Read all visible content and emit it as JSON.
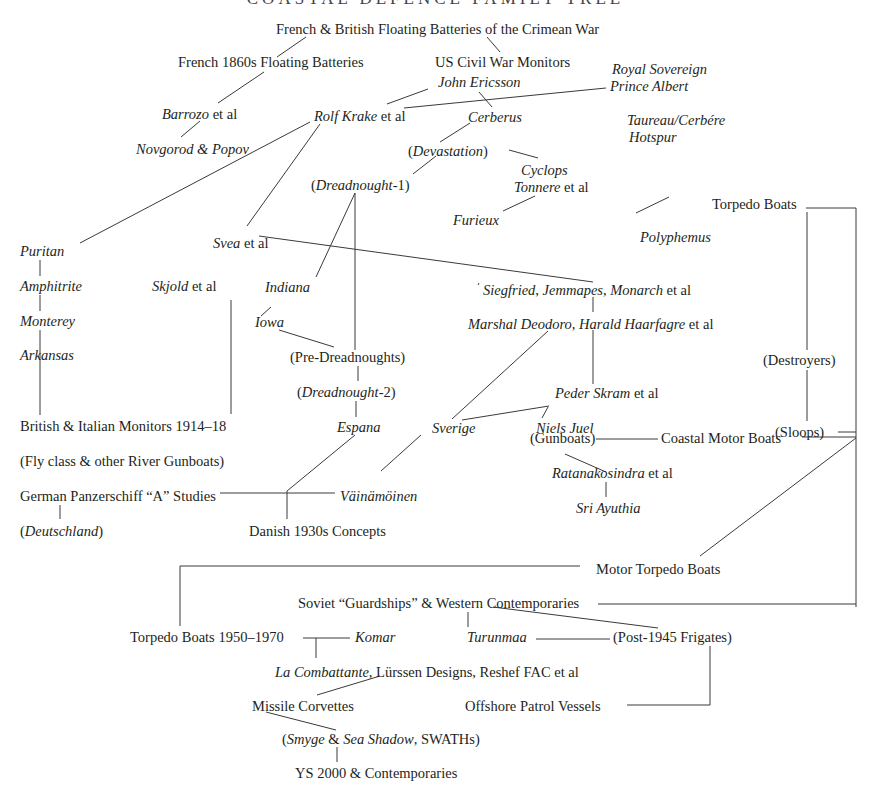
{
  "title": "COASTAL DEFENCE FAMILY TREE",
  "colors": {
    "ink": "#231f20",
    "line": "#3a3a3a",
    "background": "#ffffff"
  },
  "nodes": [
    {
      "id": "crimean",
      "parts": [
        {
          "t": "French & British Floating Batteries of the Crimean War"
        }
      ],
      "x": 276,
      "y": 21
    },
    {
      "id": "french1860s",
      "parts": [
        {
          "t": "French 1860s Floating Batteries"
        }
      ],
      "x": 178,
      "y": 54
    },
    {
      "id": "uscivilwar",
      "parts": [
        {
          "t": "US Civil War Monitors"
        }
      ],
      "x": 435,
      "y": 54
    },
    {
      "id": "royalsovereign",
      "parts": [
        {
          "t": "Royal Sovereign",
          "i": true
        }
      ],
      "x": 612,
      "y": 61
    },
    {
      "id": "princealbert",
      "parts": [
        {
          "t": "Prince Albert",
          "i": true
        }
      ],
      "x": 610,
      "y": 78
    },
    {
      "id": "johnericsson",
      "parts": [
        {
          "t": "John Ericsson",
          "i": true
        }
      ],
      "x": 438,
      "y": 74
    },
    {
      "id": "barrozo",
      "parts": [
        {
          "t": "Barrozo",
          "i": true
        },
        {
          "t": " et al"
        }
      ],
      "x": 162,
      "y": 106
    },
    {
      "id": "rolfkrake",
      "parts": [
        {
          "t": "Rolf Krake",
          "i": true
        },
        {
          "t": " et al"
        }
      ],
      "x": 314,
      "y": 108
    },
    {
      "id": "cerberus",
      "parts": [
        {
          "t": "Cerberus",
          "i": true
        }
      ],
      "x": 468,
      "y": 109
    },
    {
      "id": "taureau",
      "parts": [
        {
          "t": "Taureau/Cerbére",
          "i": true
        }
      ],
      "x": 627,
      "y": 112
    },
    {
      "id": "hotspur",
      "parts": [
        {
          "t": "Hotspur",
          "i": true
        }
      ],
      "x": 629,
      "y": 129
    },
    {
      "id": "novgorod",
      "parts": [
        {
          "t": "Novgorod & Popov",
          "i": true
        }
      ],
      "x": 136,
      "y": 141
    },
    {
      "id": "devastation",
      "parts": [
        {
          "t": "("
        },
        {
          "t": "Devastation",
          "i": true
        },
        {
          "t": ")"
        }
      ],
      "x": 408,
      "y": 143
    },
    {
      "id": "cyclops",
      "parts": [
        {
          "t": "Cyclops",
          "i": true
        }
      ],
      "x": 521,
      "y": 162
    },
    {
      "id": "dreadnought1",
      "parts": [
        {
          "t": "("
        },
        {
          "t": "Dreadnought",
          "i": true
        },
        {
          "t": "-1)"
        }
      ],
      "x": 311,
      "y": 177
    },
    {
      "id": "tonnere",
      "parts": [
        {
          "t": "Tonnere",
          "i": true
        },
        {
          "t": " et al"
        }
      ],
      "x": 514,
      "y": 179
    },
    {
      "id": "furieux",
      "parts": [
        {
          "t": "Furieux",
          "i": true
        }
      ],
      "x": 453,
      "y": 212
    },
    {
      "id": "torpedoboats",
      "parts": [
        {
          "t": "Torpedo Boats"
        }
      ],
      "x": 712,
      "y": 196
    },
    {
      "id": "polyphemus",
      "parts": [
        {
          "t": "Polyphemus",
          "i": true
        }
      ],
      "x": 640,
      "y": 229
    },
    {
      "id": "svea",
      "parts": [
        {
          "t": "Svea",
          "i": true
        },
        {
          "t": " et al"
        }
      ],
      "x": 213,
      "y": 235
    },
    {
      "id": "puritan",
      "parts": [
        {
          "t": "Puritan",
          "i": true
        }
      ],
      "x": 20,
      "y": 243
    },
    {
      "id": "amphitrite",
      "parts": [
        {
          "t": "Amphitrite",
          "i": true
        }
      ],
      "x": 20,
      "y": 278
    },
    {
      "id": "skjold",
      "parts": [
        {
          "t": "Skjold",
          "i": true
        },
        {
          "t": " et al"
        }
      ],
      "x": 152,
      "y": 278
    },
    {
      "id": "indiana",
      "parts": [
        {
          "t": "Indiana",
          "i": true
        }
      ],
      "x": 265,
      "y": 279
    },
    {
      "id": "siegfried",
      "parts": [
        {
          "t": "Siegfried",
          "i": true
        },
        {
          "t": ", "
        },
        {
          "t": "Jemmapes",
          "i": true
        },
        {
          "t": ", "
        },
        {
          "t": "Monarch",
          "i": true
        },
        {
          "t": " et al"
        }
      ],
      "x": 483,
      "y": 282
    },
    {
      "id": "monterey",
      "parts": [
        {
          "t": "Monterey",
          "i": true
        }
      ],
      "x": 20,
      "y": 313
    },
    {
      "id": "iowa",
      "parts": [
        {
          "t": "Iowa",
          "i": true
        }
      ],
      "x": 255,
      "y": 314
    },
    {
      "id": "marshal",
      "parts": [
        {
          "t": "Marshal Deodoro",
          "i": true
        },
        {
          "t": ", "
        },
        {
          "t": "Harald Haarfagre",
          "i": true
        },
        {
          "t": " et al"
        }
      ],
      "x": 468,
      "y": 316
    },
    {
      "id": "predreadnoughts",
      "parts": [
        {
          "t": "(Pre-Dreadnoughts)"
        }
      ],
      "x": 290,
      "y": 349
    },
    {
      "id": "arkansas",
      "parts": [
        {
          "t": "Arkansas",
          "i": true
        }
      ],
      "x": 20,
      "y": 347
    },
    {
      "id": "destroyers",
      "parts": [
        {
          "t": "(Destroyers)"
        }
      ],
      "x": 763,
      "y": 352
    },
    {
      "id": "dreadnought2",
      "parts": [
        {
          "t": "("
        },
        {
          "t": "Dreadnought",
          "i": true
        },
        {
          "t": "-2)"
        }
      ],
      "x": 297,
      "y": 384
    },
    {
      "id": "pederskram",
      "parts": [
        {
          "t": "Peder Skram",
          "i": true
        },
        {
          "t": " et al"
        }
      ],
      "x": 555,
      "y": 385
    },
    {
      "id": "britishitalian",
      "parts": [
        {
          "t": "British & Italian Monitors 1914–18"
        }
      ],
      "x": 20,
      "y": 418
    },
    {
      "id": "espana",
      "parts": [
        {
          "t": "Espana",
          "i": true
        }
      ],
      "x": 337,
      "y": 419
    },
    {
      "id": "sverige",
      "parts": [
        {
          "t": "Sverige",
          "i": true
        }
      ],
      "x": 432,
      "y": 420
    },
    {
      "id": "nielsjuel",
      "parts": [
        {
          "t": "Niels Juel",
          "i": true
        }
      ],
      "x": 536,
      "y": 420
    },
    {
      "id": "sloops",
      "parts": [
        {
          "t": "(Sloops)"
        }
      ],
      "x": 775,
      "y": 424
    },
    {
      "id": "flyclass",
      "parts": [
        {
          "t": "(Fly class & other River Gunboats)"
        }
      ],
      "x": 20,
      "y": 453
    },
    {
      "id": "gunboats",
      "parts": [
        {
          "t": "(Gunboats)"
        }
      ],
      "x": 530,
      "y": 430
    },
    {
      "id": "coastalmotor",
      "parts": [
        {
          "t": "Coastal Motor Boats"
        }
      ],
      "x": 661,
      "y": 430
    },
    {
      "id": "panzerschiff",
      "parts": [
        {
          "t": "German Panzerschiff “A” Studies"
        }
      ],
      "x": 20,
      "y": 488
    },
    {
      "id": "vainamoinen",
      "parts": [
        {
          "t": "Väinämöinen",
          "i": true
        }
      ],
      "x": 340,
      "y": 488
    },
    {
      "id": "ratanakosindra",
      "parts": [
        {
          "t": "Ratanakosindra",
          "i": true
        },
        {
          "t": " et al"
        }
      ],
      "x": 552,
      "y": 465
    },
    {
      "id": "deutschland",
      "parts": [
        {
          "t": "("
        },
        {
          "t": "Deutschland",
          "i": true
        },
        {
          "t": ")"
        }
      ],
      "x": 20,
      "y": 523
    },
    {
      "id": "danish",
      "parts": [
        {
          "t": "Danish 1930s Concepts"
        }
      ],
      "x": 249,
      "y": 523
    },
    {
      "id": "sriayuthia",
      "parts": [
        {
          "t": "Sri Ayuthia",
          "i": true
        }
      ],
      "x": 576,
      "y": 500
    },
    {
      "id": "motortorpedo",
      "parts": [
        {
          "t": "Motor Torpedo Boats"
        }
      ],
      "x": 596,
      "y": 561
    },
    {
      "id": "soviet",
      "parts": [
        {
          "t": "Soviet “Guardships” & Western Contemporaries"
        }
      ],
      "x": 298,
      "y": 595
    },
    {
      "id": "tb1950",
      "parts": [
        {
          "t": "Torpedo Boats 1950–1970"
        }
      ],
      "x": 130,
      "y": 629
    },
    {
      "id": "komar",
      "parts": [
        {
          "t": "Komar",
          "i": true
        }
      ],
      "x": 355,
      "y": 629
    },
    {
      "id": "turunmaa",
      "parts": [
        {
          "t": "Turunmaa",
          "i": true
        }
      ],
      "x": 467,
      "y": 629
    },
    {
      "id": "postfrigates",
      "parts": [
        {
          "t": "(Post-1945 Frigates)"
        }
      ],
      "x": 613,
      "y": 629
    },
    {
      "id": "lacombattante",
      "parts": [
        {
          "t": "La Combattante",
          "i": true
        },
        {
          "t": ", Lürssen Designs, Reshef FAC et al"
        }
      ],
      "x": 275,
      "y": 664
    },
    {
      "id": "missile",
      "parts": [
        {
          "t": "Missile Corvettes"
        }
      ],
      "x": 252,
      "y": 698
    },
    {
      "id": "offshore",
      "parts": [
        {
          "t": "Offshore Patrol Vessels"
        }
      ],
      "x": 465,
      "y": 698
    },
    {
      "id": "smyge",
      "parts": [
        {
          "t": "("
        },
        {
          "t": "Smyge",
          "i": true
        },
        {
          "t": " & "
        },
        {
          "t": "Sea Shadow",
          "i": true
        },
        {
          "t": ", SWATHs)"
        }
      ],
      "x": 282,
      "y": 731
    },
    {
      "id": "ys2000",
      "parts": [
        {
          "t": "YS 2000 & Contemporaries"
        }
      ],
      "x": 295,
      "y": 765
    }
  ],
  "edges": [
    [
      306,
      37,
      277,
      57
    ],
    [
      487,
      37,
      500,
      52
    ],
    [
      264,
      72,
      218,
      103
    ],
    [
      200,
      121,
      181,
      137
    ],
    [
      428,
      89,
      387,
      104
    ],
    [
      404,
      108,
      606,
      88
    ],
    [
      479,
      92,
      492,
      107
    ],
    [
      470,
      123,
      440,
      142
    ],
    [
      509,
      150,
      538,
      158
    ],
    [
      436,
      156,
      413,
      174
    ],
    [
      535,
      196,
      503,
      211
    ],
    [
      310,
      122,
      80,
      243
    ],
    [
      320,
      124,
      247,
      226
    ],
    [
      355,
      193,
      316,
      277
    ],
    [
      355,
      193,
      355,
      350
    ],
    [
      271,
      307,
      261,
      316
    ],
    [
      279,
      330,
      334,
      347
    ],
    [
      358,
      366,
      358,
      381
    ],
    [
      356,
      401,
      356,
      417
    ],
    [
      355,
      435,
      287,
      491
    ],
    [
      287,
      491,
      287,
      519
    ],
    [
      220,
      493,
      335,
      493
    ],
    [
      478,
      285,
      479,
      283
    ],
    [
      259,
      236,
      593,
      282
    ],
    [
      593,
      297,
      593,
      312
    ],
    [
      593,
      330,
      593,
      384
    ],
    [
      549,
      406,
      462,
      420
    ],
    [
      548,
      407,
      542,
      418
    ],
    [
      548,
      331,
      452,
      419
    ],
    [
      421,
      435,
      381,
      471
    ],
    [
      231,
      300,
      231,
      414
    ],
    [
      40,
      260,
      40,
      276
    ],
    [
      40,
      295,
      40,
      311
    ],
    [
      40,
      330,
      40,
      415
    ],
    [
      60,
      505,
      60,
      519
    ],
    [
      636,
      213,
      669,
      197
    ],
    [
      806,
      208,
      856,
      208
    ],
    [
      856,
      208,
      856,
      607
    ],
    [
      807,
      212,
      807,
      350
    ],
    [
      807,
      370,
      807,
      421
    ],
    [
      838,
      432,
      856,
      432
    ],
    [
      596,
      439,
      658,
      439
    ],
    [
      802,
      437,
      856,
      437
    ],
    [
      565,
      454,
      606,
      472
    ],
    [
      606,
      482,
      606,
      497
    ],
    [
      700,
      556,
      856,
      438
    ],
    [
      180,
      566,
      580,
      566
    ],
    [
      180,
      566,
      180,
      626
    ],
    [
      598,
      604,
      856,
      604
    ],
    [
      493,
      607,
      658,
      628
    ],
    [
      468,
      612,
      468,
      627
    ],
    [
      303,
      638,
      350,
      638
    ],
    [
      316,
      638,
      316,
      658
    ],
    [
      536,
      639,
      610,
      639
    ],
    [
      710,
      646,
      710,
      705
    ],
    [
      627,
      705,
      710,
      705
    ],
    [
      317,
      695,
      380,
      676
    ],
    [
      266,
      712,
      336,
      730
    ],
    [
      337,
      747,
      337,
      762
    ]
  ]
}
